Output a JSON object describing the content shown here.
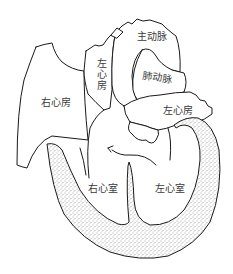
{
  "diagram": {
    "type": "heart-anatomy-cross-section",
    "colors": {
      "background": "#ffffff",
      "outline": "#1a1a1a",
      "text": "#3a3a3a",
      "myocardium_stipple": "#555555"
    },
    "labels": {
      "aorta": "主动脉",
      "left_atrium_upper": "左心房",
      "pulmonary_artery": "肺动脉",
      "right_atrium": "右心房",
      "left_atrium": "左心房",
      "right_ventricle": "右心室",
      "left_ventricle": "左心室"
    }
  }
}
